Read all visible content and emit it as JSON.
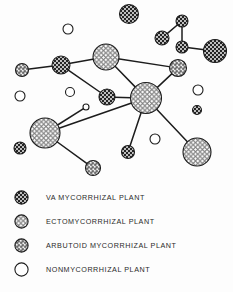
{
  "figure": {
    "background_color": "#fdfdfd",
    "line_color": "#1c1c1c",
    "outline_color": "#1c1c1c"
  },
  "chart_data": {
    "type": "scatter",
    "title": "",
    "xlabel": "",
    "ylabel": "",
    "grid": false,
    "legend_position": "bottom-left",
    "node_types": {
      "va": {
        "key": "va",
        "label": "VA MYCORRHIZAL PLANT",
        "fill_color": "#2b2b2b",
        "pattern": "dense-dark-check"
      },
      "ecto": {
        "key": "ecto",
        "label": "ECTOMYCORRHIZAL PLANT",
        "fill_color": "#f2f2f2",
        "pattern": "open-mesh"
      },
      "arbutoid": {
        "key": "arbutoid",
        "label": "ARBUTOID MYCORRHIZAL PLANT",
        "fill_color": "#9a9a9a",
        "pattern": "medium-check"
      },
      "none": {
        "key": "none",
        "label": "NONMYCORRHIZAL PLANT",
        "fill_color": "#ffffff",
        "pattern": "empty"
      }
    },
    "nodes": [
      {
        "id": "n1",
        "type": "va",
        "x": 129,
        "y": 14,
        "r": 9.5
      },
      {
        "id": "n2",
        "type": "va",
        "x": 182,
        "y": 21,
        "r": 6.0
      },
      {
        "id": "n3",
        "type": "va",
        "x": 162,
        "y": 38,
        "r": 7.0
      },
      {
        "id": "n4",
        "type": "va",
        "x": 182,
        "y": 47,
        "r": 6.0
      },
      {
        "id": "n5",
        "type": "va",
        "x": 215,
        "y": 51,
        "r": 11.5
      },
      {
        "id": "n6",
        "type": "none",
        "x": 68,
        "y": 29,
        "r": 5.0
      },
      {
        "id": "n7",
        "type": "ecto",
        "x": 106,
        "y": 57,
        "r": 13.0
      },
      {
        "id": "n8",
        "type": "va",
        "x": 61,
        "y": 65,
        "r": 9.0
      },
      {
        "id": "n9",
        "type": "arbutoid",
        "x": 22,
        "y": 70,
        "r": 6.5
      },
      {
        "id": "n10",
        "type": "arbutoid",
        "x": 178,
        "y": 68,
        "r": 8.5
      },
      {
        "id": "n11",
        "type": "none",
        "x": 20,
        "y": 96,
        "r": 5.0
      },
      {
        "id": "n12",
        "type": "none",
        "x": 70,
        "y": 92,
        "r": 4.5
      },
      {
        "id": "n13",
        "type": "va",
        "x": 107,
        "y": 97,
        "r": 8.0
      },
      {
        "id": "n14",
        "type": "ecto",
        "x": 146,
        "y": 98,
        "r": 15.5
      },
      {
        "id": "n15",
        "type": "none",
        "x": 198,
        "y": 90,
        "r": 5.0
      },
      {
        "id": "n16",
        "type": "va",
        "x": 197,
        "y": 110,
        "r": 4.5
      },
      {
        "id": "n17",
        "type": "none",
        "x": 86,
        "y": 107,
        "r": 3.0
      },
      {
        "id": "n18",
        "type": "ecto",
        "x": 45,
        "y": 133,
        "r": 15.0
      },
      {
        "id": "n19",
        "type": "va",
        "x": 20,
        "y": 148,
        "r": 6.0
      },
      {
        "id": "n20",
        "type": "none",
        "x": 155,
        "y": 139,
        "r": 5.0
      },
      {
        "id": "n21",
        "type": "ecto",
        "x": 197,
        "y": 152,
        "r": 14.0
      },
      {
        "id": "n22",
        "type": "va",
        "x": 128,
        "y": 152,
        "r": 6.5
      },
      {
        "id": "n23",
        "type": "arbutoid",
        "x": 93,
        "y": 168,
        "r": 7.5
      }
    ],
    "edges": [
      {
        "from": "n2",
        "to": "n3"
      },
      {
        "from": "n2",
        "to": "n4"
      },
      {
        "from": "n4",
        "to": "n5"
      },
      {
        "from": "n7",
        "to": "n8"
      },
      {
        "from": "n8",
        "to": "n9"
      },
      {
        "from": "n7",
        "to": "n10"
      },
      {
        "from": "n10",
        "to": "n14"
      },
      {
        "from": "n7",
        "to": "n14"
      },
      {
        "from": "n8",
        "to": "n13"
      },
      {
        "from": "n13",
        "to": "n14"
      },
      {
        "from": "n14",
        "to": "n18"
      },
      {
        "from": "n14",
        "to": "n21"
      },
      {
        "from": "n14",
        "to": "n22"
      },
      {
        "from": "n18",
        "to": "n17"
      },
      {
        "from": "n18",
        "to": "n23"
      }
    ]
  },
  "legend": {
    "items": [
      {
        "type": "va",
        "label": "VA MYCORRHIZAL PLANT"
      },
      {
        "type": "ecto",
        "label": "ECTOMYCORRHIZAL PLANT"
      },
      {
        "type": "arbutoid",
        "label": "ARBUTOID MYCORRHIZAL PLANT"
      },
      {
        "type": "none",
        "label": "NONMYCORRHIZAL PLANT"
      }
    ]
  }
}
